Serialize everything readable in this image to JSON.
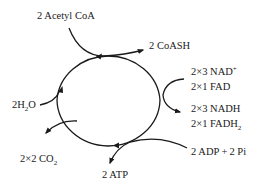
{
  "diagram": {
    "title": "",
    "type": "cycle",
    "inputs": {
      "acetyl_coa": "2 Acetyl CoA",
      "water_prefix": "2H",
      "water_sub": "2",
      "water_suffix": "O",
      "nad": "2×3 NAD",
      "nad_sup": "+",
      "fad": "2×1 FAD",
      "adp": "2 ADP + 2 Pi"
    },
    "outputs": {
      "coash": "2 CoASH",
      "nadh": "2×3 NADH",
      "fadh_prefix": "2×1 FADH",
      "fadh_sub": "2",
      "co2_prefix": "2×2 CO",
      "co2_sub": "2",
      "atp": "2 ATP"
    },
    "colors": {
      "line": "#1a1a1a",
      "text": "#1a1a1a",
      "background": "#ffffff"
    }
  }
}
